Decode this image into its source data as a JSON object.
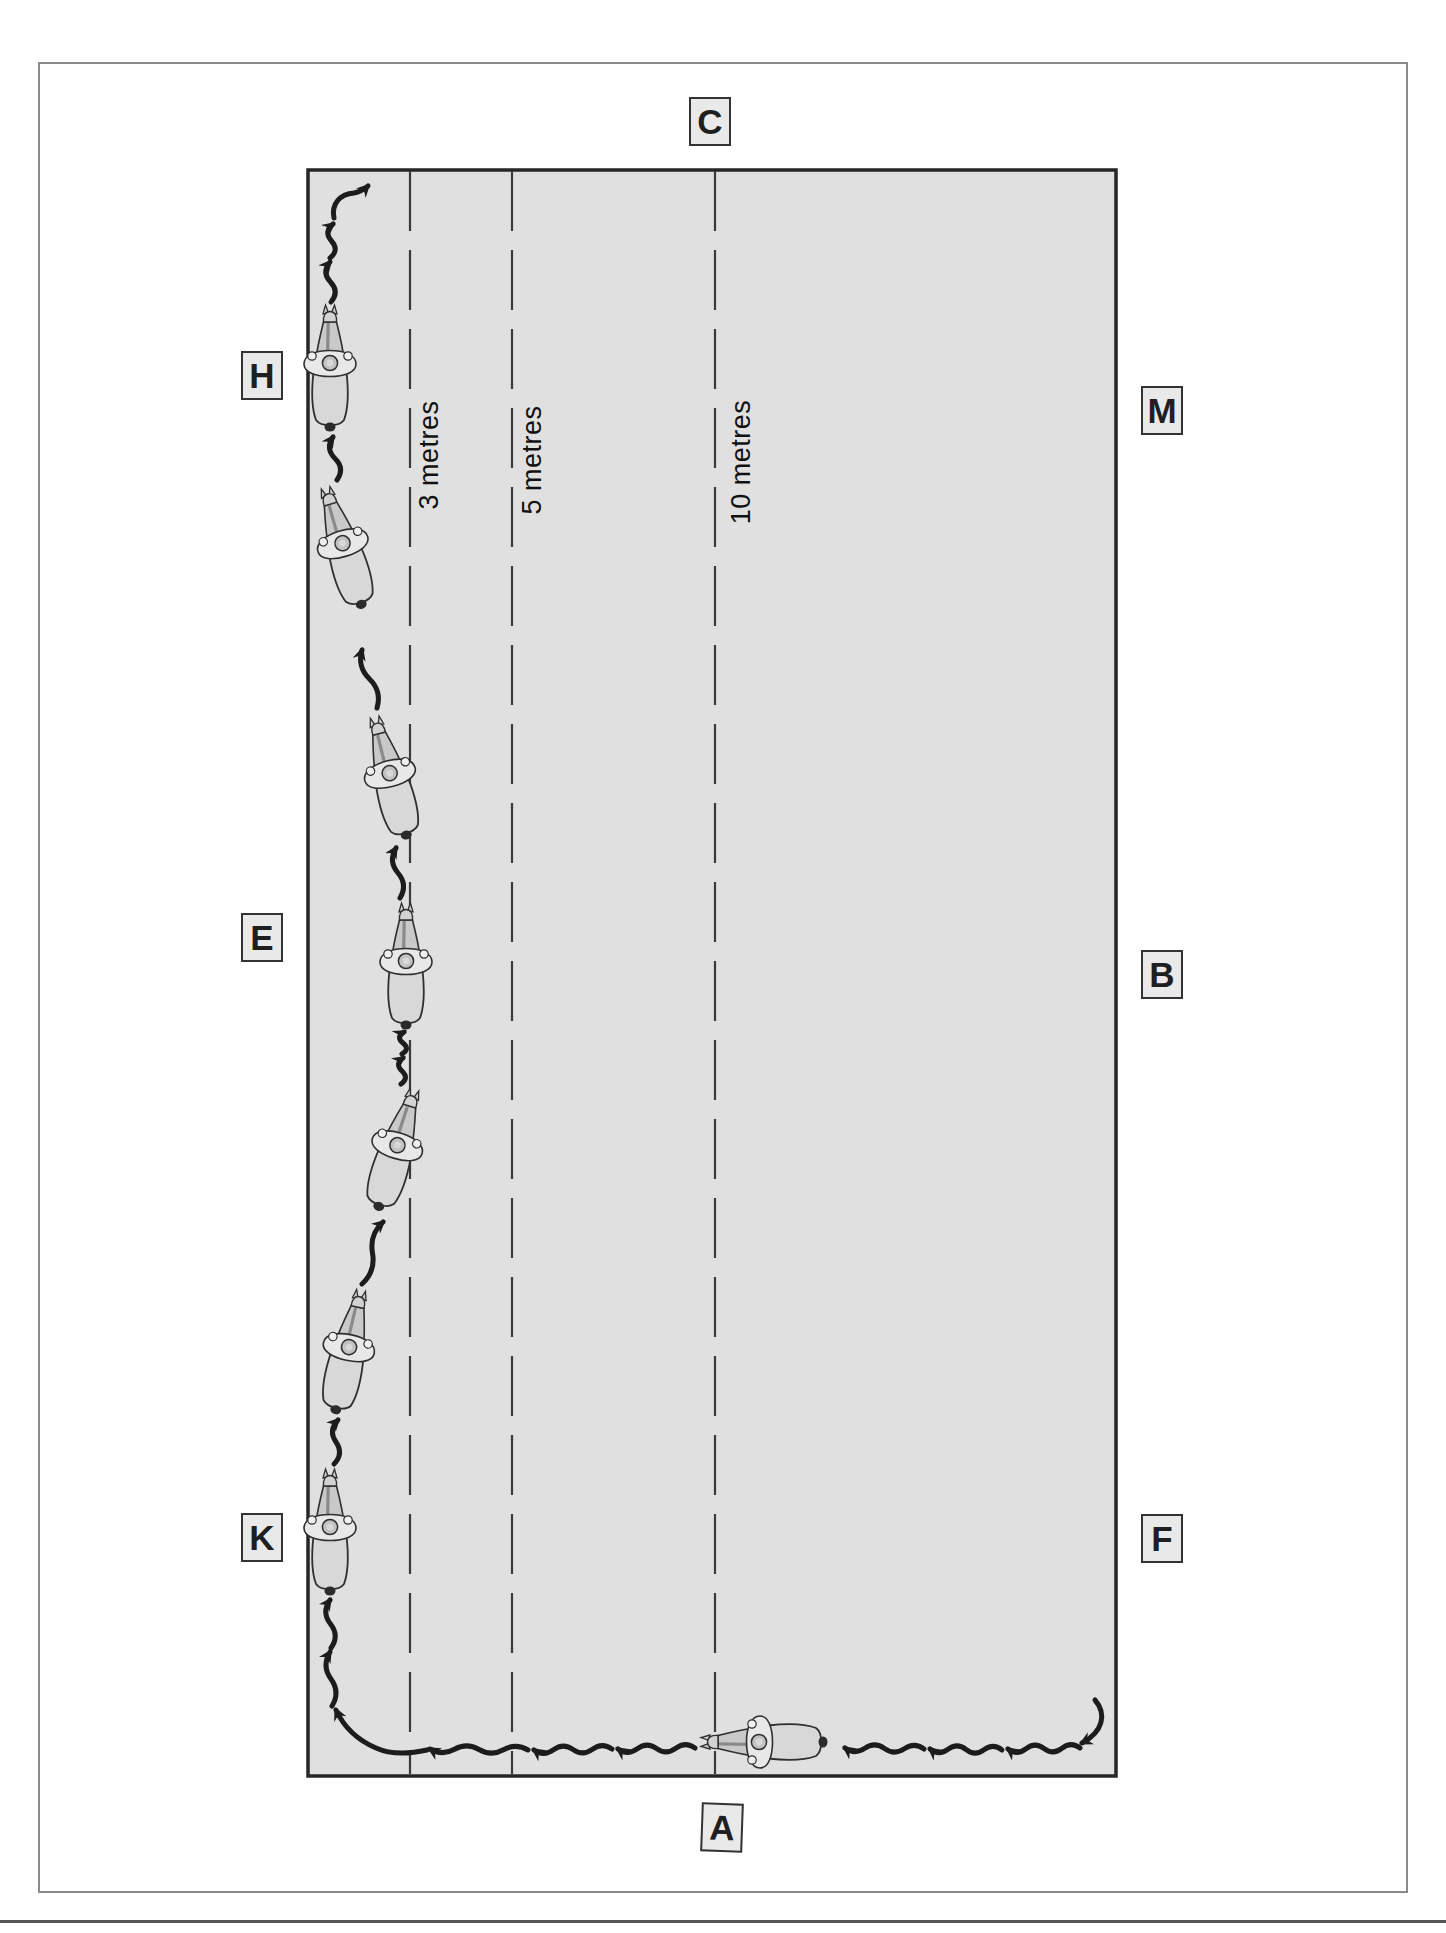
{
  "figure": {
    "kind": "dressage-arena-diagram",
    "shown_exercise": "shallow serpentine loops ridden along the left long side from A towards C"
  },
  "arena": {
    "rect": {
      "left": 308,
      "top": 170,
      "right": 1116,
      "bottom": 1776
    },
    "letters": [
      {
        "label": "C",
        "cx": 710,
        "cy": 121,
        "tilt": 0
      },
      {
        "label": "H",
        "cx": 262,
        "cy": 375,
        "tilt": 0
      },
      {
        "label": "M",
        "cx": 1162,
        "cy": 410,
        "tilt": 0
      },
      {
        "label": "E",
        "cx": 262,
        "cy": 937,
        "tilt": 0
      },
      {
        "label": "B",
        "cx": 1162,
        "cy": 974,
        "tilt": 0
      },
      {
        "label": "K",
        "cx": 262,
        "cy": 1537,
        "tilt": 0
      },
      {
        "label": "F",
        "cx": 1162,
        "cy": 1538,
        "tilt": 0
      },
      {
        "label": "A",
        "cx": 722,
        "cy": 1827,
        "tilt": 2
      }
    ],
    "distance_lines": [
      {
        "label": "3 metres",
        "meters": 3,
        "x": 410,
        "label_cx": 429,
        "label_cy": 455
      },
      {
        "label": "5 metres",
        "meters": 5,
        "x": 512,
        "label_cx": 532,
        "label_cy": 460
      },
      {
        "label": "10 metres",
        "meters": 10,
        "x": 715,
        "label_cx": 741,
        "label_cy": 462
      }
    ]
  },
  "horses": [
    {
      "x": 330,
      "y": 368,
      "rot": 0
    },
    {
      "x": 344,
      "y": 548,
      "rot": -17
    },
    {
      "x": 391,
      "y": 778,
      "rot": -15
    },
    {
      "x": 406,
      "y": 966,
      "rot": 0
    },
    {
      "x": 396,
      "y": 1150,
      "rot": 17
    },
    {
      "x": 348,
      "y": 1352,
      "rot": 12
    },
    {
      "x": 330,
      "y": 1532,
      "rot": 0
    },
    {
      "x": 764,
      "y": 1742,
      "rot": -90
    }
  ],
  "path": {
    "wave_segments": [
      {
        "x0": 331,
        "y0": 302,
        "x1": 330,
        "y1": 262,
        "waves": 1,
        "amp": 9
      },
      {
        "x0": 330,
        "y0": 258,
        "x1": 333,
        "y1": 224,
        "waves": 1,
        "amp": 9
      },
      {
        "x0": 337,
        "y0": 480,
        "x1": 333,
        "y1": 437,
        "waves": 1,
        "amp": 9
      },
      {
        "x0": 377,
        "y0": 708,
        "x1": 362,
        "y1": 650,
        "waves": 1,
        "amp": 9
      },
      {
        "x0": 400,
        "y0": 898,
        "x1": 396,
        "y1": 848,
        "waves": 1,
        "amp": 9
      },
      {
        "x0": 401,
        "y0": 1084,
        "x1": 403,
        "y1": 1058,
        "waves": 1,
        "amp": 8
      },
      {
        "x0": 402,
        "y0": 1054,
        "x1": 404,
        "y1": 1032,
        "waves": 1,
        "amp": 8
      },
      {
        "x0": 362,
        "y0": 1284,
        "x1": 383,
        "y1": 1222,
        "waves": 1,
        "amp": 9
      },
      {
        "x0": 334,
        "y0": 1464,
        "x1": 338,
        "y1": 1420,
        "waves": 1,
        "amp": 9
      },
      {
        "x0": 332,
        "y0": 1706,
        "x1": 330,
        "y1": 1652,
        "waves": 1,
        "amp": 9
      },
      {
        "x0": 331,
        "y0": 1648,
        "x1": 330,
        "y1": 1600,
        "waves": 1,
        "amp": 9
      },
      {
        "x0": 1080,
        "y0": 1748,
        "x1": 1008,
        "y1": 1749,
        "waves": 2,
        "amp": 7
      },
      {
        "x0": 1002,
        "y0": 1750,
        "x1": 930,
        "y1": 1749,
        "waves": 2,
        "amp": 7
      },
      {
        "x0": 924,
        "y0": 1749,
        "x1": 845,
        "y1": 1748,
        "waves": 2,
        "amp": 7
      },
      {
        "x0": 695,
        "y0": 1748,
        "x1": 618,
        "y1": 1749,
        "waves": 2,
        "amp": 7
      },
      {
        "x0": 612,
        "y0": 1749,
        "x1": 534,
        "y1": 1750,
        "waves": 2,
        "amp": 7
      },
      {
        "x0": 528,
        "y0": 1750,
        "x1": 430,
        "y1": 1749,
        "waves": 2,
        "amp": 7
      }
    ],
    "special_segments": [
      {
        "name": "start-hook-bottom-right",
        "d": "M 1095 1700 C 1107 1714 1103 1732 1082 1743"
      },
      {
        "name": "corner-turn-bottom-left",
        "d": "M 427 1750 Q 396 1757 376 1748 Q 348 1736 336 1710"
      },
      {
        "name": "finish-hook-top-left",
        "d": "M 334 218 C 331 204 340 194 354 193 Q 363 191 368 186"
      }
    ],
    "dash_pattern": "60 19"
  },
  "colors": {
    "page_bg": "#ffffff",
    "page_border": "#8a8a8a",
    "arena_fill": "#e0e0e0",
    "arena_border": "#262626",
    "dash_line": "#3a3a3a",
    "path_stroke": "#1c1c1c",
    "marker_fill": "#e9e9e9",
    "marker_border": "#333333",
    "letter_color": "#1f1f1f",
    "label_color": "#111111",
    "footer_rule": "#555555"
  },
  "page": {
    "border_rect": {
      "left": 38,
      "top": 62,
      "right": 1408,
      "bottom": 1893
    },
    "footer_rule_y": 1920
  }
}
